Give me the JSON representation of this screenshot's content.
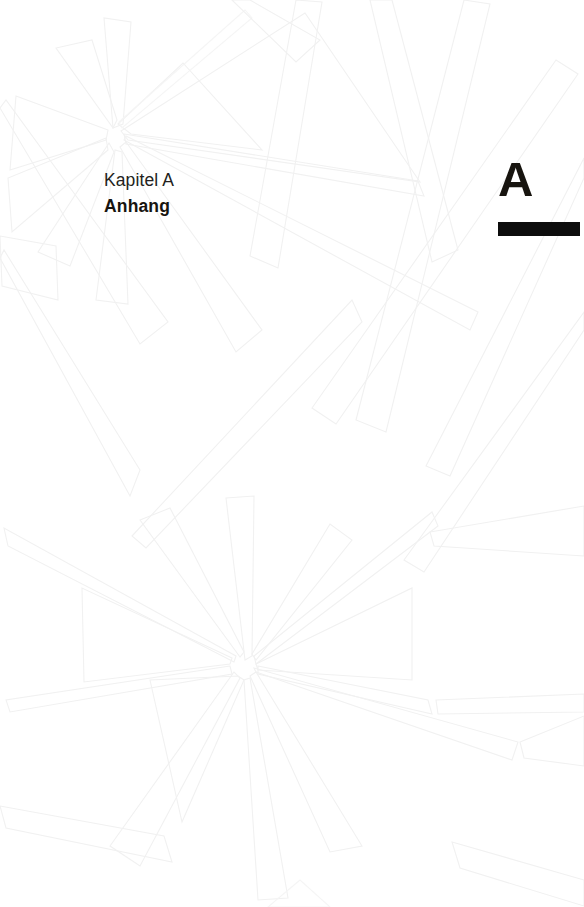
{
  "page": {
    "width": 584,
    "height": 907,
    "background_color": "#ffffff",
    "language": "de"
  },
  "chapter_label": {
    "kicker": "Kapitel A",
    "title": "Anhang",
    "kicker_color": "#231f20",
    "title_color": "#17140f"
  },
  "chapter_marker": {
    "letter": "A",
    "letter_color": "#17140f",
    "rule_color": "#0d0d0d"
  },
  "decoration": {
    "name": "starburst-line-art-watermark",
    "stroke_color": "#f1f1f1",
    "soft_stroke_color": "#f5f5f5",
    "centers": [
      {
        "x": 113,
        "y": 128
      },
      {
        "x": 245,
        "y": 660
      }
    ]
  }
}
